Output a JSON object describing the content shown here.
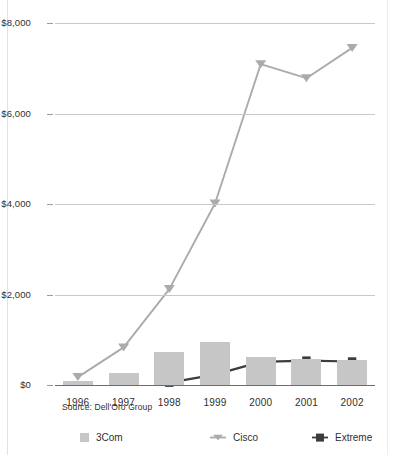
{
  "chart_data": {
    "type": "bar",
    "title": "",
    "subtitle": "",
    "xlabel": "",
    "ylabel": "",
    "categories": [
      "1996",
      "1997",
      "1998",
      "1999",
      "2000",
      "2001",
      "2002"
    ],
    "ylim": [
      0,
      8000
    ],
    "ytick_labels": [
      "$0",
      "$2,000",
      "$4,000",
      "$6,000",
      "$8,000"
    ],
    "ytick_values": [
      0,
      2000,
      4000,
      6000,
      8000
    ],
    "grid": true,
    "legend_position": "bottom",
    "annotations": [
      "Source: Dell'Oro Group"
    ],
    "series": [
      {
        "name": "3Com",
        "type": "bar",
        "color": "#c6c6c6",
        "values": [
          80,
          260,
          720,
          940,
          610,
          570,
          550
        ]
      },
      {
        "name": "Cisco",
        "type": "line",
        "color": "#ababab",
        "marker": "triangle-down",
        "values": [
          175,
          830,
          2120,
          4010,
          7090,
          6780,
          7450
        ]
      },
      {
        "name": "Extreme",
        "type": "line",
        "color": "#3c3c3c",
        "marker": "square",
        "values": [
          0,
          0,
          50,
          230,
          510,
          540,
          520
        ]
      }
    ]
  },
  "source": {
    "label": "Source: Dell'Oro Group"
  },
  "legend": {
    "items": [
      {
        "label": "3Com",
        "swatch": "bar-swatch",
        "color": "#c6c6c6"
      },
      {
        "label": "Cisco",
        "swatch": "triangle-marker",
        "color": "#ababab"
      },
      {
        "label": "Extreme",
        "swatch": "square-marker",
        "color": "#3c3c3c"
      }
    ]
  }
}
